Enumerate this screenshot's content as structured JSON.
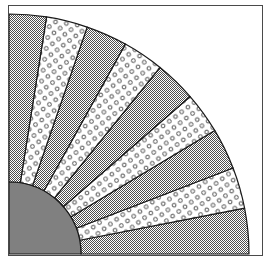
{
  "figure": {
    "background_color": "#ffffff",
    "frame": {
      "visible": true,
      "stroke_color": "#4a4a4a",
      "stroke_width": 1,
      "x": 8,
      "y": 5,
      "width": 255,
      "height": 251
    }
  },
  "chart_data": {
    "type": "pie",
    "title": "",
    "subtitle": "",
    "xlabel": "",
    "ylabel": "",
    "legend": [],
    "annotations": [],
    "grid": false,
    "orientation": "quarter-circle",
    "center": {
      "x": 9,
      "y": 254
    },
    "inner_radius": 72,
    "outer_radius": 240,
    "start_angle_deg": 0,
    "end_angle_deg": 90,
    "total_sweep_deg": 90,
    "slice_count": 9,
    "categories": [
      "wedge-1",
      "wedge-2",
      "wedge-3",
      "wedge-4",
      "wedge-5",
      "wedge-6",
      "wedge-7",
      "wedge-8",
      "wedge-9"
    ],
    "values": [
      11,
      10,
      10,
      10,
      10,
      10,
      10,
      10,
      9
    ],
    "slices": [
      {
        "name": "wedge-1",
        "start_deg": 0,
        "end_deg": 11,
        "fill": "checker",
        "value": 11
      },
      {
        "name": "wedge-2",
        "start_deg": 11,
        "end_deg": 21,
        "fill": "dots",
        "value": 10
      },
      {
        "name": "wedge-3",
        "start_deg": 21,
        "end_deg": 31,
        "fill": "checker",
        "value": 10
      },
      {
        "name": "wedge-4",
        "start_deg": 31,
        "end_deg": 41,
        "fill": "dots",
        "value": 10
      },
      {
        "name": "wedge-5",
        "start_deg": 41,
        "end_deg": 51,
        "fill": "checker",
        "value": 10
      },
      {
        "name": "wedge-6",
        "start_deg": 51,
        "end_deg": 61,
        "fill": "dots",
        "value": 10
      },
      {
        "name": "wedge-7",
        "start_deg": 61,
        "end_deg": 71,
        "fill": "checker",
        "value": 10
      },
      {
        "name": "wedge-8",
        "start_deg": 71,
        "end_deg": 81,
        "fill": "dots",
        "value": 10
      },
      {
        "name": "wedge-9",
        "start_deg": 81,
        "end_deg": 90,
        "fill": "checker",
        "value": 9
      }
    ],
    "core": {
      "name": "inner-core",
      "shape": "quarter-disc",
      "radius": 72,
      "fill": "solid-gray",
      "color": "#808080"
    },
    "palette": {
      "checker_fill": "#a6a6a6",
      "checker_dark": "#555555",
      "dots_background": "#ffffff",
      "dots_ring": "#4d4d4d",
      "solid_core": "#808080",
      "outline": "#1a1a1a",
      "frame": "#4a4a4a"
    },
    "styles": {
      "wedge_outline_width": 1.2,
      "core_outline_width": 1.2
    }
  }
}
